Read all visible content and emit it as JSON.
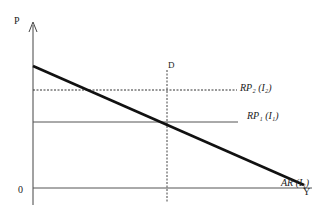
{
  "diagram": {
    "y_axis_label": "P",
    "x_axis_label": "Y",
    "origin_label": "0",
    "vertical_line_label": "D",
    "curves": [
      {
        "name": "RP2",
        "label": "RP₂ (I₂)",
        "style": "dotted"
      },
      {
        "name": "RP1",
        "label": "RP₁ (I₁)",
        "style": "solid"
      },
      {
        "name": "AR",
        "label": "AR (I₁)",
        "style": "thick-solid"
      }
    ]
  }
}
